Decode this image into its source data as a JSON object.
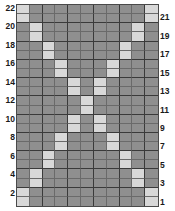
{
  "chart_data": {
    "type": "heatmap",
    "title": "",
    "xlabel": "",
    "ylabel": "",
    "columns": 11,
    "rows": 22,
    "legend": [
      {
        "name": "background-stitch",
        "color": "#8f8f8f"
      },
      {
        "name": "pattern-stitch",
        "color": "#d8d8d8"
      }
    ],
    "left_row_labels": [
      "22",
      "20",
      "18",
      "16",
      "14",
      "12",
      "10",
      "8",
      "6",
      "4",
      "2"
    ],
    "right_row_labels": [
      "21",
      "19",
      "17",
      "15",
      "13",
      "11",
      "9",
      "7",
      "5",
      "3",
      "1"
    ],
    "row_numbers_top_to_bottom": [
      22,
      21,
      20,
      19,
      18,
      17,
      16,
      15,
      14,
      13,
      12,
      11,
      10,
      9,
      8,
      7,
      6,
      5,
      4,
      3,
      2,
      1
    ],
    "cells_top_to_bottom": [
      [
        1,
        0,
        0,
        0,
        0,
        0,
        0,
        0,
        0,
        0,
        1
      ],
      [
        1,
        0,
        0,
        0,
        0,
        0,
        0,
        0,
        0,
        0,
        1
      ],
      [
        0,
        1,
        0,
        0,
        0,
        0,
        0,
        0,
        0,
        1,
        0
      ],
      [
        0,
        1,
        0,
        0,
        0,
        0,
        0,
        0,
        0,
        1,
        0
      ],
      [
        0,
        0,
        1,
        0,
        0,
        0,
        0,
        0,
        1,
        0,
        0
      ],
      [
        0,
        0,
        1,
        0,
        0,
        0,
        0,
        0,
        1,
        0,
        0
      ],
      [
        0,
        0,
        0,
        1,
        0,
        0,
        0,
        1,
        0,
        0,
        0
      ],
      [
        0,
        0,
        0,
        1,
        0,
        0,
        0,
        1,
        0,
        0,
        0
      ],
      [
        0,
        0,
        0,
        0,
        1,
        0,
        1,
        0,
        0,
        0,
        0
      ],
      [
        0,
        0,
        0,
        0,
        1,
        0,
        1,
        0,
        0,
        0,
        0
      ],
      [
        0,
        0,
        0,
        0,
        0,
        1,
        0,
        0,
        0,
        0,
        0
      ],
      [
        0,
        0,
        0,
        0,
        0,
        1,
        0,
        0,
        0,
        0,
        0
      ],
      [
        0,
        0,
        0,
        0,
        1,
        0,
        1,
        0,
        0,
        0,
        0
      ],
      [
        0,
        0,
        0,
        0,
        1,
        0,
        1,
        0,
        0,
        0,
        0
      ],
      [
        0,
        0,
        0,
        1,
        0,
        0,
        0,
        1,
        0,
        0,
        0
      ],
      [
        0,
        0,
        0,
        1,
        0,
        0,
        0,
        1,
        0,
        0,
        0
      ],
      [
        0,
        0,
        1,
        0,
        0,
        0,
        0,
        0,
        1,
        0,
        0
      ],
      [
        0,
        0,
        1,
        0,
        0,
        0,
        0,
        0,
        1,
        0,
        0
      ],
      [
        0,
        1,
        0,
        0,
        0,
        0,
        0,
        0,
        0,
        1,
        0
      ],
      [
        0,
        1,
        0,
        0,
        0,
        0,
        0,
        0,
        0,
        1,
        0
      ],
      [
        1,
        0,
        0,
        0,
        0,
        0,
        0,
        0,
        0,
        0,
        1
      ],
      [
        1,
        0,
        0,
        0,
        0,
        0,
        0,
        0,
        0,
        0,
        1
      ]
    ]
  }
}
